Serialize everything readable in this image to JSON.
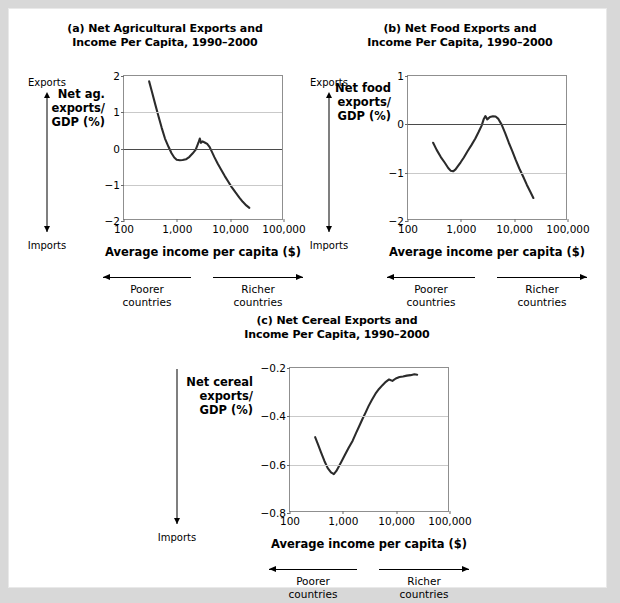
{
  "page": {
    "background": "#ffffff",
    "frame_color": "#d8d8d8"
  },
  "axis_common": {
    "xlabel": "Average income per capita ($)",
    "xticks": [
      "100",
      "1,000",
      "10,000",
      "100,000"
    ],
    "xtick_values": [
      100,
      1000,
      10000,
      100000
    ],
    "exports_label": "Exports",
    "imports_label": "Imports",
    "poorer_label_line1": "Poorer",
    "poorer_label_line2": "countries",
    "richer_label_line1": "Richer",
    "richer_label_line2": "countries",
    "line_color": "#2b2b2b",
    "grid_color": "#c9c9c9",
    "zero_color": "#4a4a4a"
  },
  "chart_data": [
    {
      "id": "a",
      "type": "line",
      "title_line1": "(a) Net Agricultural Exports and",
      "title_line2": "Income Per Capita, 1990–2000",
      "ylabel_line1": "Net ag.",
      "ylabel_line2": "exports/",
      "ylabel_line3": "GDP (%)",
      "xlabel": "Average income per capita ($)",
      "xscale": "log",
      "xlim": [
        100,
        100000
      ],
      "ylim": [
        -2,
        2
      ],
      "yticks": [
        "2",
        "1",
        "0",
        "−1",
        "−2"
      ],
      "ytick_values": [
        2,
        1,
        0,
        -1,
        -2
      ],
      "gridlines": [
        1,
        0,
        -1
      ],
      "has_exports_cap": true,
      "has_imports_cap": true,
      "x": [
        300,
        340,
        390,
        450,
        520,
        600,
        700,
        800,
        900,
        1000,
        1150,
        1300,
        1500,
        1750,
        2000,
        2300,
        2600,
        2750,
        2900,
        3100,
        3400,
        3800,
        4200,
        4600,
        5200,
        6000,
        7000,
        8200,
        9500,
        11000,
        13000,
        15500,
        18000,
        21000,
        24000
      ],
      "y": [
        1.85,
        1.55,
        1.22,
        0.88,
        0.55,
        0.25,
        0.02,
        -0.16,
        -0.28,
        -0.34,
        -0.355,
        -0.35,
        -0.33,
        -0.26,
        -0.17,
        -0.06,
        0.14,
        0.25,
        0.13,
        0.17,
        0.14,
        0.1,
        0.02,
        -0.1,
        -0.27,
        -0.45,
        -0.62,
        -0.8,
        -0.95,
        -1.1,
        -1.25,
        -1.4,
        -1.52,
        -1.62,
        -1.69
      ]
    },
    {
      "id": "b",
      "type": "line",
      "title_line1": "(b) Net Food Exports and",
      "title_line2": "Income Per Capita, 1990–2000",
      "ylabel_line1": "Net food",
      "ylabel_line2": "exports/",
      "ylabel_line3": "GDP (%)",
      "xlabel": "Average income per capita ($)",
      "xscale": "log",
      "xlim": [
        100,
        100000
      ],
      "ylim": [
        -2,
        1
      ],
      "yticks": [
        "1",
        "0",
        "−1",
        "−2"
      ],
      "ytick_values": [
        1,
        0,
        -1,
        -2
      ],
      "gridlines": [
        0,
        -1
      ],
      "has_exports_cap": true,
      "has_imports_cap": true,
      "x": [
        300,
        350,
        420,
        500,
        580,
        650,
        720,
        800,
        900,
        1000,
        1150,
        1350,
        1600,
        1900,
        2200,
        2500,
        2750,
        2950,
        3200,
        3600,
        4100,
        4600,
        5200,
        6000,
        7000,
        8200,
        9600,
        11000,
        13000,
        15500,
        18000,
        21000,
        24000
      ],
      "y": [
        -0.4,
        -0.55,
        -0.7,
        -0.82,
        -0.93,
        -0.99,
        -1.0,
        -0.96,
        -0.88,
        -0.81,
        -0.71,
        -0.58,
        -0.45,
        -0.31,
        -0.17,
        -0.04,
        0.1,
        0.16,
        0.09,
        0.14,
        0.155,
        0.15,
        0.1,
        -0.02,
        -0.2,
        -0.4,
        -0.58,
        -0.75,
        -0.94,
        -1.12,
        -1.28,
        -1.43,
        -1.56
      ]
    },
    {
      "id": "c",
      "type": "line",
      "title_line1": "(c) Net Cereal Exports and",
      "title_line2": "Income Per Capita, 1990–2000",
      "ylabel_line1": "Net cereal",
      "ylabel_line2": "exports/",
      "ylabel_line3": "GDP (%)",
      "xlabel": "Average income per capita ($)",
      "xscale": "log",
      "xlim": [
        100,
        100000
      ],
      "ylim": [
        -0.8,
        -0.2
      ],
      "yticks": [
        "−0.2",
        "−0.4",
        "−0.6",
        "−0.8"
      ],
      "ytick_values": [
        -0.2,
        -0.4,
        -0.6,
        -0.8
      ],
      "gridlines": [
        -0.4,
        -0.6
      ],
      "has_exports_cap": false,
      "has_imports_cap": true,
      "x": [
        300,
        340,
        390,
        450,
        520,
        600,
        680,
        760,
        850,
        950,
        1100,
        1300,
        1550,
        1800,
        2100,
        2400,
        2750,
        3100,
        3600,
        4200,
        4900,
        5700,
        6600,
        7600,
        8800,
        10200,
        12000,
        14000,
        16500,
        19500,
        23000,
        26000
      ],
      "y": [
        -0.49,
        -0.52,
        -0.555,
        -0.59,
        -0.62,
        -0.638,
        -0.645,
        -0.632,
        -0.612,
        -0.592,
        -0.565,
        -0.535,
        -0.505,
        -0.472,
        -0.44,
        -0.412,
        -0.385,
        -0.36,
        -0.333,
        -0.308,
        -0.288,
        -0.272,
        -0.258,
        -0.248,
        -0.254,
        -0.244,
        -0.238,
        -0.236,
        -0.232,
        -0.23,
        -0.226,
        -0.228
      ]
    }
  ]
}
